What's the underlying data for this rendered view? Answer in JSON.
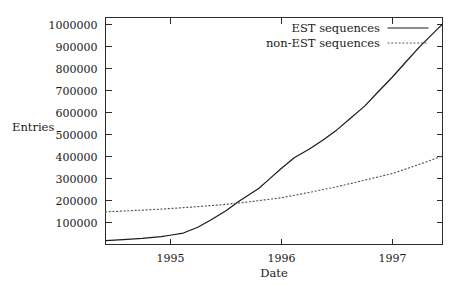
{
  "chart_data": {
    "type": "line",
    "title": "",
    "xlabel": "Date",
    "ylabel": "Entries",
    "xlim": [
      1994.42,
      1997.45
    ],
    "ylim": [
      0,
      1030000
    ],
    "grid": false,
    "legend_position": "top-right-inside",
    "xticks": [
      {
        "value": 1995,
        "label": "1995"
      },
      {
        "value": 1996,
        "label": "1996"
      },
      {
        "value": 1997,
        "label": "1997"
      }
    ],
    "yticks": [
      {
        "value": 100000,
        "label": "100000"
      },
      {
        "value": 200000,
        "label": "200000"
      },
      {
        "value": 300000,
        "label": "300000"
      },
      {
        "value": 400000,
        "label": "400000"
      },
      {
        "value": 500000,
        "label": "500000"
      },
      {
        "value": 600000,
        "label": "600000"
      },
      {
        "value": 700000,
        "label": "700000"
      },
      {
        "value": 800000,
        "label": "800000"
      },
      {
        "value": 900000,
        "label": "900000"
      },
      {
        "value": 1000000,
        "label": "1000000"
      }
    ],
    "series": [
      {
        "name": "EST sequences",
        "style": "solid",
        "color": "#1a1a1a",
        "points": [
          [
            1994.42,
            18000
          ],
          [
            1994.58,
            22000
          ],
          [
            1994.75,
            28000
          ],
          [
            1994.92,
            36000
          ],
          [
            1995.0,
            42000
          ],
          [
            1995.12,
            52000
          ],
          [
            1995.25,
            78000
          ],
          [
            1995.37,
            112000
          ],
          [
            1995.5,
            152000
          ],
          [
            1995.62,
            196000
          ],
          [
            1995.7,
            222000
          ],
          [
            1995.8,
            255000
          ],
          [
            1995.9,
            300000
          ],
          [
            1996.0,
            345000
          ],
          [
            1996.12,
            395000
          ],
          [
            1996.25,
            432000
          ],
          [
            1996.37,
            472000
          ],
          [
            1996.5,
            520000
          ],
          [
            1996.62,
            572000
          ],
          [
            1996.75,
            628000
          ],
          [
            1996.87,
            692000
          ],
          [
            1997.0,
            760000
          ],
          [
            1997.12,
            828000
          ],
          [
            1997.25,
            900000
          ],
          [
            1997.37,
            960000
          ],
          [
            1997.45,
            1000000
          ]
        ]
      },
      {
        "name": "non-EST sequences",
        "style": "dotted",
        "color": "#5a5a5a",
        "points": [
          [
            1994.42,
            148000
          ],
          [
            1994.75,
            156000
          ],
          [
            1995.0,
            163000
          ],
          [
            1995.25,
            172000
          ],
          [
            1995.5,
            182000
          ],
          [
            1995.75,
            196000
          ],
          [
            1996.0,
            212000
          ],
          [
            1996.25,
            236000
          ],
          [
            1996.5,
            262000
          ],
          [
            1996.75,
            292000
          ],
          [
            1997.0,
            322000
          ],
          [
            1997.25,
            365000
          ],
          [
            1997.45,
            402000
          ]
        ]
      }
    ],
    "legend": [
      {
        "label": "EST sequences",
        "style": "solid"
      },
      {
        "label": "non-EST sequences",
        "style": "dotted"
      }
    ]
  }
}
